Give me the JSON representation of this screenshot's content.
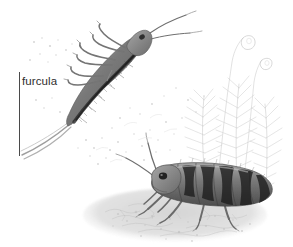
{
  "figure": {
    "kind": "scientific-illustration",
    "medium": "graphite-pencil-drawing",
    "palette": "grayscale",
    "background_color": "#ffffff",
    "width": 293,
    "height": 247,
    "ink_color": "#3a3a3a",
    "label_color": "#2e2e2e",
    "leader_color": "#4a4a4a"
  },
  "annotations": {
    "labels": [
      {
        "id": "furcula",
        "text": "furcula",
        "x": 22,
        "y": 75,
        "font_size": 11.5,
        "color": "#2e2e2e"
      }
    ],
    "leaders": [
      {
        "id": "furcula-leader",
        "orientation": "vertical",
        "x": 19,
        "y": 72,
        "length": 84,
        "color": "#4a4a4a"
      }
    ]
  },
  "scene": {
    "elements": [
      {
        "id": "leaping-springtail",
        "name": "springtail-upper",
        "description": "springtail mid-leap, body arched, furcula extended",
        "position": "upper-left",
        "segments": 6,
        "antennae": 2,
        "legs": 6,
        "shade": "#7d7d7d"
      },
      {
        "id": "walking-springtail",
        "name": "springtail-lower",
        "description": "springtail walking on soil, banded abdomen",
        "position": "lower-right",
        "segments": 6,
        "antennae": 2,
        "legs": 6,
        "shade": "#6f6f6f"
      },
      {
        "id": "moss-clump",
        "name": "moss-plant",
        "description": "feathery moss fronds with sporophyte capsules",
        "position": "right",
        "fronds": 3,
        "capsules": 2,
        "shade": "#b9b9b9"
      },
      {
        "id": "soil-ground",
        "name": "soil-substrate",
        "description": "textured soil and organic detritus",
        "position": "bottom",
        "shade": "#c2c2c2"
      },
      {
        "id": "debris-specks",
        "name": "scattered-debris",
        "description": "faint scattered soil particles and spores",
        "position": "center",
        "shade": "#d8d8d8"
      }
    ]
  }
}
